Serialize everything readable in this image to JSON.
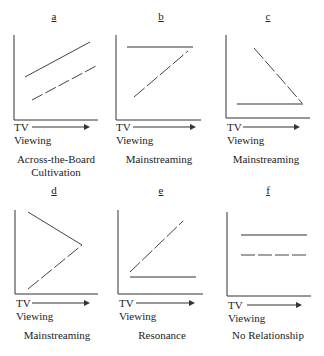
{
  "panels": [
    {
      "letter": "a",
      "caption_line1": "Across-the-Board",
      "caption_line2": "Cultivation",
      "axis_label_1": "TV",
      "axis_label_2": "Viewing"
    },
    {
      "letter": "b",
      "caption_line1": "Mainstreaming",
      "caption_line2": "",
      "axis_label_1": "TV",
      "axis_label_2": "Viewing"
    },
    {
      "letter": "c",
      "caption_line1": "Mainstreaming",
      "caption_line2": "",
      "axis_label_1": "TV",
      "axis_label_2": "Viewing"
    },
    {
      "letter": "d",
      "caption_line1": "Mainstreaming",
      "caption_line2": "",
      "axis_label_1": "TV",
      "axis_label_2": "Viewing"
    },
    {
      "letter": "e",
      "caption_line1": "Resonance",
      "caption_line2": "",
      "axis_label_1": "TV",
      "axis_label_2": "Viewing"
    },
    {
      "letter": "f",
      "caption_line1": "No Relationship",
      "caption_line2": "",
      "axis_label_1": "TV",
      "axis_label_2": "Viewing"
    }
  ],
  "colors": {
    "line": "#333333",
    "background": "#ffffff"
  }
}
